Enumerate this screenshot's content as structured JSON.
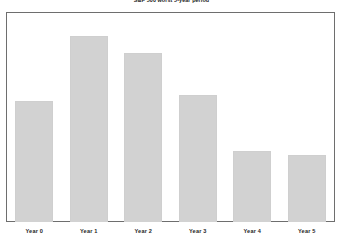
{
  "chart_data": {
    "type": "bar",
    "title": "S&P 500 worst 5-year period",
    "xlabel": "",
    "ylabel": "",
    "categories": [
      "Year 0",
      "Year 1",
      "Year 2",
      "Year 3",
      "Year 4",
      "Year 5"
    ],
    "values": [
      58,
      89,
      81,
      61,
      34,
      32
    ],
    "ylim": [
      0,
      100
    ],
    "grid": false,
    "legend": null,
    "bar_color": "#d2d2d2",
    "bar_edge_color": "#cfcfcf",
    "frame_color": "#6e6e6e",
    "background": "#ffffff",
    "text_color": "#1a1a1a"
  },
  "bars": [
    {
      "label": "Year 0",
      "value": 58,
      "height_pct": "58%"
    },
    {
      "label": "Year 1",
      "value": 89,
      "height_pct": "89%"
    },
    {
      "label": "Year 2",
      "value": 81,
      "height_pct": "81%"
    },
    {
      "label": "Year 3",
      "value": 61,
      "height_pct": "61%"
    },
    {
      "label": "Year 4",
      "value": 34,
      "height_pct": "34%"
    },
    {
      "label": "Year 5",
      "value": 32,
      "height_pct": "32%"
    }
  ]
}
